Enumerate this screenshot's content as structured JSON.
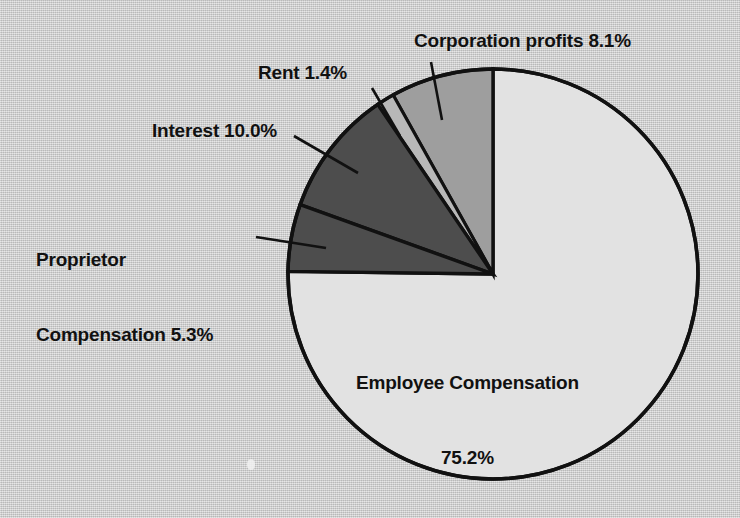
{
  "figure": {
    "background_color": "#c8c8c8",
    "outline_color": "#111111",
    "text_color": "#111111"
  },
  "labels": {
    "corporation": "Corporation profits 8.1%",
    "rent": "Rent 1.4%",
    "interest": "Interest 10.0%",
    "proprietor_line1": "Proprietor",
    "proprietor_line2": "Compensation 5.3%",
    "employee_line1": "Employee Compensation",
    "employee_line2": "75.2%"
  },
  "chart_data": {
    "type": "pie",
    "title": "",
    "subtitle": "",
    "xlabel": "",
    "ylabel": "",
    "grid": false,
    "legend_position": "none",
    "units": "percent",
    "total": 100.0,
    "center": {
      "x": 493,
      "y": 274
    },
    "radius": 205,
    "start_angle_deg": 90,
    "direction": "counterclockwise",
    "categories": [
      "Employee Compensation",
      "Corporation profits",
      "Rent",
      "Interest",
      "Proprietor Compensation"
    ],
    "values": [
      75.2,
      8.1,
      1.4,
      10.0,
      5.3
    ],
    "slices": [
      {
        "name": "Employee Compensation",
        "value": 75.2,
        "label": "Employee Compensation",
        "value_label": "75.2%",
        "color": "#e2e2e2",
        "label_placement": "inside",
        "start_deg": 90.0,
        "end_deg": -180.72
      },
      {
        "name": "Corporation profits",
        "value": 8.1,
        "label": "Corporation profits",
        "value_label": "8.1%",
        "color": "#9e9e9e",
        "label_placement": "outside-leader",
        "start_deg": 90.0,
        "end_deg": 119.16
      },
      {
        "name": "Rent",
        "value": 1.4,
        "label": "Rent",
        "value_label": "1.4%",
        "color": "#b8b8b8",
        "label_placement": "outside-leader",
        "start_deg": 119.16,
        "end_deg": 124.2
      },
      {
        "name": "Interest",
        "value": 10.0,
        "label": "Interest",
        "value_label": "10.0%",
        "color": "#4d4d4d",
        "label_placement": "outside-leader",
        "start_deg": 124.2,
        "end_deg": 160.2
      },
      {
        "name": "Proprietor Compensation",
        "value": 5.3,
        "label": "Proprietor Compensation",
        "value_label": "5.3%",
        "color": "#4d4d4d",
        "label_placement": "outside-leader",
        "start_deg": 160.2,
        "end_deg": 179.28
      }
    ]
  }
}
